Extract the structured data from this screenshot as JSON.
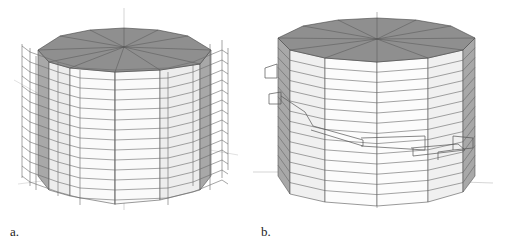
{
  "figure": {
    "panels": [
      {
        "id": "a",
        "label": "a.",
        "description": "Polygonal cylinder with dense wireframe bracing boxes around all sides"
      },
      {
        "id": "b",
        "label": "b.",
        "description": "Polygonal cylinder with horizontal bands and a single helical wireframe path"
      }
    ],
    "colors": {
      "top_face": "#8f8f8f",
      "side_light": "#f3f3f3",
      "side_dark": "#a8a8a8",
      "edge": "#555555",
      "wire": "#6a6a6a"
    }
  }
}
